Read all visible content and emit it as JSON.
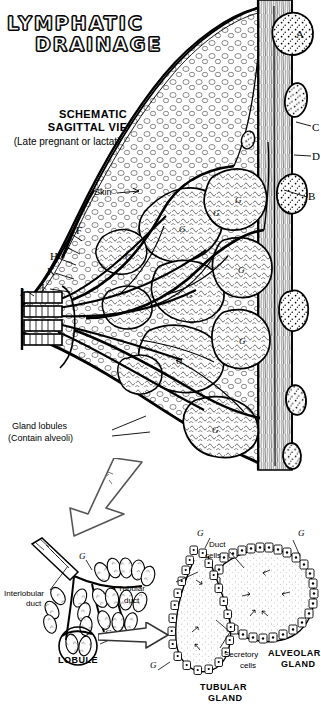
{
  "figure": {
    "title_line1": "LYMPHATIC",
    "title_line2": "DRAINAGE",
    "title_tail": "L",
    "heading_line1": "SCHEMATIC",
    "heading_line2": "SAGITTAL VIEW",
    "heading_sub": "(Late pregnant or lactating breast)"
  },
  "main_labels": {
    "skin": "Skin",
    "gland_lobules_line1": "Gland lobules",
    "gland_lobules_line2": "(Contain alveoli)"
  },
  "key_letters": {
    "a": "A",
    "b": "B",
    "c": "C",
    "d": "D",
    "e": "E",
    "f": "F",
    "h": "H",
    "i": "I",
    "j": "J",
    "k": "K",
    "g": "G"
  },
  "lobule_detail": {
    "interlobular_duct_line1": "Interlobular",
    "interlobular_duct_line2": "duct",
    "tubular_duct_line1": "Tubular",
    "tubular_duct_line2": "duct",
    "caption": "LOBULE",
    "g_label": "G"
  },
  "gland_detail": {
    "duct_cells_line1": "Duct",
    "duct_cells_line2": "cells",
    "secretory_cells_line1": "Secretory",
    "secretory_cells_line2": "cells",
    "alveolar_caption_line1": "ALVEOLAR",
    "alveolar_caption_line2": "GLAND",
    "tubular_caption_line1": "TUBULAR",
    "tubular_caption_line2": "GLAND",
    "g_label": "G"
  },
  "colors": {
    "ink": "#000000",
    "paper": "#ffffff",
    "light_ink": "#555555"
  }
}
